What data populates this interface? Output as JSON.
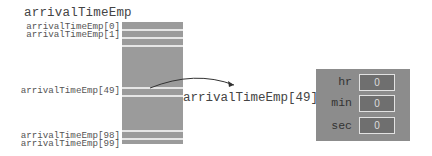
{
  "diagram": {
    "array_name": "arrivalTimeEmp",
    "index_labels": [
      "arrivalTimeEmp[0]",
      "arrivalTimeEmp[1]",
      "arrivalTimeEmp[49]",
      "arrivalTimeEmp[98]",
      "arrivalTimeEmp[99]"
    ],
    "pointer_label": "arrivalTimeEmp[49]",
    "struct": {
      "fields": [
        {
          "name": "hr",
          "value": "0"
        },
        {
          "name": "min",
          "value": "0"
        },
        {
          "name": "sec",
          "value": "0"
        }
      ]
    },
    "colors": {
      "array_fill": "#9b9b9b",
      "stripe": "#e6e6e6",
      "struct_fill": "#8c8c8c",
      "field_fill": "#6f6f6f"
    }
  }
}
